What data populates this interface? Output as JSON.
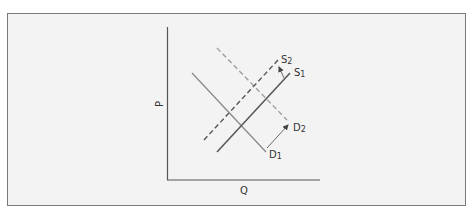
{
  "diagram": {
    "type": "supply-demand-shift",
    "axes": {
      "x_label": "Q",
      "y_label": "P"
    },
    "curves": [
      {
        "id": "D1",
        "label": "D1",
        "label_main": "D",
        "label_sub": "1",
        "kind": "demand",
        "style": "solid",
        "color": "#8a8a8a"
      },
      {
        "id": "D2",
        "label": "D2",
        "label_main": "D",
        "label_sub": "2",
        "kind": "demand",
        "style": "dashed",
        "color": "#9a9a9a"
      },
      {
        "id": "S1",
        "label": "S1",
        "label_main": "S",
        "label_sub": "1",
        "kind": "supply",
        "style": "solid",
        "color": "#555555"
      },
      {
        "id": "S2",
        "label": "S2",
        "label_main": "S",
        "label_sub": "2",
        "kind": "supply",
        "style": "dashed",
        "color": "#555555"
      }
    ],
    "shifts": [
      {
        "from": "S1",
        "to": "S2",
        "direction": "left"
      },
      {
        "from": "D1",
        "to": "D2",
        "direction": "right"
      }
    ],
    "colors": {
      "frame_border": "#7a7a7a",
      "frame_background": "#f3f3f3",
      "axis": "#555555",
      "arrow": "#444444"
    }
  }
}
